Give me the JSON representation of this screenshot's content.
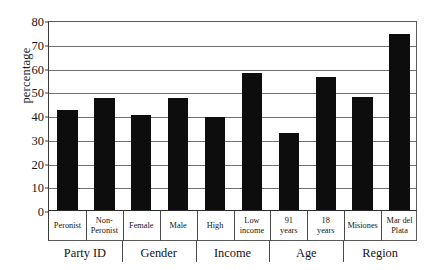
{
  "chart_data": {
    "type": "bar",
    "title": "",
    "xlabel": "",
    "ylabel": "percentage",
    "ylim": [
      0,
      80
    ],
    "yticks": [
      0,
      10,
      20,
      30,
      40,
      50,
      60,
      70,
      80
    ],
    "grid": true,
    "legend": null,
    "bar_color": "#0d0d0d",
    "categories": [
      "Peronist",
      "Non-Peronist",
      "Female",
      "Male",
      "High",
      "Low income",
      "91 years",
      "18 years",
      "Misiones",
      "Mar del Plata"
    ],
    "category_lines": [
      [
        "Peronist"
      ],
      [
        "Non-",
        "Peronist"
      ],
      [
        "Female"
      ],
      [
        "Male"
      ],
      [
        "High"
      ],
      [
        "Low",
        "income"
      ],
      [
        "91",
        "years"
      ],
      [
        "18",
        "years"
      ],
      [
        "Misiones"
      ],
      [
        "Mar del",
        "Plata"
      ]
    ],
    "values": [
      42,
      47,
      40,
      47,
      39,
      57.5,
      32.5,
      56,
      47.5,
      74
    ],
    "groups": [
      {
        "label": "Party ID",
        "span": 2
      },
      {
        "label": "Gender",
        "span": 2
      },
      {
        "label": "Income",
        "span": 2
      },
      {
        "label": "Age",
        "span": 2
      },
      {
        "label": "Region",
        "span": 2
      }
    ]
  }
}
